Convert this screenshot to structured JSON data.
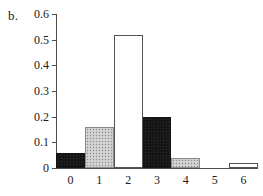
{
  "panel": {
    "label": "b."
  },
  "chart_data": {
    "type": "bar",
    "title": "",
    "subtitle": "",
    "xlabel": "",
    "ylabel": "",
    "categories": [
      "0",
      "1",
      "2",
      "3",
      "4",
      "5",
      "6"
    ],
    "values": [
      0.06,
      0.16,
      0.52,
      0.2,
      0.04,
      0.0,
      0.02
    ],
    "bar_styles": [
      "black",
      "gray",
      "white",
      "black",
      "gray",
      "none",
      "white"
    ],
    "ylim": [
      0,
      0.6
    ],
    "ytick_labels": [
      "0",
      "0.1",
      "0.2",
      "0.3",
      "0.4",
      "0.5",
      "0.6"
    ],
    "ytick_values": [
      0,
      0.1,
      0.2,
      0.3,
      0.4,
      0.5,
      0.6
    ],
    "xtick_labels": [
      "0",
      "1",
      "2",
      "3",
      "4",
      "5",
      "6"
    ],
    "grid": false,
    "legend": null,
    "bar_gap": 0,
    "colors": {
      "black_fill": "#151515",
      "gray_fill": "#c9c9c9",
      "white_fill": "#ffffff",
      "outline": "#545454",
      "axis": "#4d4d4d",
      "text": "#1a1a1a",
      "background": "#ffffff"
    }
  }
}
